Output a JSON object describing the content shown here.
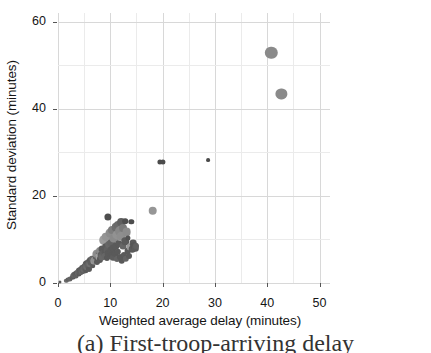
{
  "chart_data": {
    "type": "scatter",
    "title": "",
    "xlabel": "Weighted average delay  (minutes)",
    "ylabel": "Standard deviation (minutes)",
    "xlim": [
      0,
      52
    ],
    "ylim": [
      0,
      62
    ],
    "xticks": [
      0,
      10,
      20,
      30,
      40,
      50
    ],
    "yticks": [
      0,
      20,
      40,
      60
    ],
    "xtick_labels": [
      "0",
      "10",
      "20",
      "30",
      "40",
      "50"
    ],
    "ytick_labels": [
      "0",
      "20",
      "40",
      "60"
    ],
    "x_minor_step": 5,
    "y_minor_step": 10,
    "grid": true,
    "legend": "none",
    "marker_color_dark": "#5a5a5a",
    "marker_color_light": "#9a9a9a",
    "grid_color": "#d8d8d8",
    "axis_color": "#555555",
    "points": [
      {
        "x": 0.4,
        "y": 0.2,
        "r": 1.6,
        "c": "#5a5a5a"
      },
      {
        "x": 1.6,
        "y": 0.5,
        "r": 2.2,
        "c": "#6a6a6a"
      },
      {
        "x": 2.0,
        "y": 0.8,
        "r": 2.4,
        "c": "#5f5f5f"
      },
      {
        "x": 2.3,
        "y": 1.0,
        "r": 2.6,
        "c": "#646464"
      },
      {
        "x": 2.6,
        "y": 1.2,
        "r": 2.3,
        "c": "#5a5a5a"
      },
      {
        "x": 2.8,
        "y": 1.5,
        "r": 2.8,
        "c": "#606060"
      },
      {
        "x": 3.0,
        "y": 1.3,
        "r": 2.4,
        "c": "#5a5a5a"
      },
      {
        "x": 3.1,
        "y": 1.8,
        "r": 3.0,
        "c": "#656565"
      },
      {
        "x": 3.3,
        "y": 2.0,
        "r": 2.7,
        "c": "#5c5c5c"
      },
      {
        "x": 3.5,
        "y": 1.6,
        "r": 2.5,
        "c": "#606060"
      },
      {
        "x": 3.6,
        "y": 2.4,
        "r": 3.1,
        "c": "#5a5a5a"
      },
      {
        "x": 3.8,
        "y": 2.2,
        "r": 2.9,
        "c": "#686868"
      },
      {
        "x": 4.0,
        "y": 2.0,
        "r": 2.6,
        "c": "#5a5a5a"
      },
      {
        "x": 4.0,
        "y": 2.8,
        "r": 3.2,
        "c": "#626262"
      },
      {
        "x": 4.2,
        "y": 2.5,
        "r": 2.8,
        "c": "#5e5e5e"
      },
      {
        "x": 4.3,
        "y": 3.1,
        "r": 3.0,
        "c": "#5a5a5a"
      },
      {
        "x": 4.5,
        "y": 2.7,
        "r": 3.4,
        "c": "#666666"
      },
      {
        "x": 4.6,
        "y": 3.4,
        "r": 2.9,
        "c": "#5a5a5a"
      },
      {
        "x": 4.8,
        "y": 3.0,
        "r": 3.3,
        "c": "#606060"
      },
      {
        "x": 4.9,
        "y": 3.7,
        "r": 3.1,
        "c": "#5d5d5d"
      },
      {
        "x": 5.0,
        "y": 3.2,
        "r": 3.6,
        "c": "#6a6a6a"
      },
      {
        "x": 5.1,
        "y": 4.0,
        "r": 3.0,
        "c": "#5a5a5a"
      },
      {
        "x": 5.2,
        "y": 3.5,
        "r": 3.4,
        "c": "#636363"
      },
      {
        "x": 5.3,
        "y": 2.9,
        "r": 2.7,
        "c": "#5a5a5a"
      },
      {
        "x": 5.4,
        "y": 4.3,
        "r": 3.2,
        "c": "#5f5f5f"
      },
      {
        "x": 5.5,
        "y": 3.8,
        "r": 3.8,
        "c": "#6d6d6d"
      },
      {
        "x": 5.6,
        "y": 4.6,
        "r": 2.9,
        "c": "#5a5a5a"
      },
      {
        "x": 5.8,
        "y": 4.1,
        "r": 3.5,
        "c": "#646464"
      },
      {
        "x": 5.9,
        "y": 3.3,
        "r": 3.0,
        "c": "#5a5a5a"
      },
      {
        "x": 6.0,
        "y": 4.9,
        "r": 3.3,
        "c": "#616161"
      },
      {
        "x": 6.1,
        "y": 4.4,
        "r": 3.7,
        "c": "#707070"
      },
      {
        "x": 6.2,
        "y": 5.2,
        "r": 3.0,
        "c": "#5a5a5a"
      },
      {
        "x": 6.4,
        "y": 4.7,
        "r": 3.4,
        "c": "#5e5e5e"
      },
      {
        "x": 6.5,
        "y": 5.5,
        "r": 3.2,
        "c": "#676767"
      },
      {
        "x": 6.6,
        "y": 4.0,
        "r": 2.8,
        "c": "#5a5a5a"
      },
      {
        "x": 6.8,
        "y": 5.0,
        "r": 3.6,
        "c": "#9a9a9a"
      },
      {
        "x": 7.0,
        "y": 5.8,
        "r": 3.1,
        "c": "#5a5a5a"
      },
      {
        "x": 7.1,
        "y": 5.3,
        "r": 3.9,
        "c": "#8f8f8f"
      },
      {
        "x": 7.2,
        "y": 6.2,
        "r": 3.3,
        "c": "#606060"
      },
      {
        "x": 7.4,
        "y": 4.8,
        "r": 3.0,
        "c": "#5a5a5a"
      },
      {
        "x": 7.5,
        "y": 6.6,
        "r": 4.6,
        "c": "#8d8d8d"
      },
      {
        "x": 7.6,
        "y": 5.6,
        "r": 3.4,
        "c": "#5a5a5a"
      },
      {
        "x": 7.8,
        "y": 7.0,
        "r": 3.2,
        "c": "#656565"
      },
      {
        "x": 7.9,
        "y": 6.0,
        "r": 3.7,
        "c": "#a0a0a0"
      },
      {
        "x": 8.0,
        "y": 5.4,
        "r": 3.1,
        "c": "#5a5a5a"
      },
      {
        "x": 8.1,
        "y": 7.4,
        "r": 4.0,
        "c": "#8a8a8a"
      },
      {
        "x": 8.2,
        "y": 6.4,
        "r": 3.3,
        "c": "#5d5d5d"
      },
      {
        "x": 8.4,
        "y": 5.9,
        "r": 3.6,
        "c": "#686868"
      },
      {
        "x": 8.5,
        "y": 7.8,
        "r": 3.4,
        "c": "#5a5a5a"
      },
      {
        "x": 8.6,
        "y": 6.8,
        "r": 3.0,
        "c": "#626262"
      },
      {
        "x": 8.8,
        "y": 9.8,
        "r": 4.8,
        "c": "#9d9d9d"
      },
      {
        "x": 8.9,
        "y": 7.2,
        "r": 3.5,
        "c": "#5a5a5a"
      },
      {
        "x": 9.0,
        "y": 6.3,
        "r": 3.2,
        "c": "#666666"
      },
      {
        "x": 9.1,
        "y": 8.2,
        "r": 3.8,
        "c": "#5a5a5a"
      },
      {
        "x": 9.2,
        "y": 10.6,
        "r": 4.3,
        "c": "#949494"
      },
      {
        "x": 9.3,
        "y": 5.7,
        "r": 3.1,
        "c": "#5a5a5a"
      },
      {
        "x": 9.4,
        "y": 7.6,
        "r": 3.4,
        "c": "#606060"
      },
      {
        "x": 9.5,
        "y": 15.2,
        "r": 3.6,
        "c": "#4e4e4e"
      },
      {
        "x": 9.6,
        "y": 6.9,
        "r": 3.3,
        "c": "#5a5a5a"
      },
      {
        "x": 9.8,
        "y": 8.8,
        "r": 3.9,
        "c": "#676767"
      },
      {
        "x": 9.9,
        "y": 6.1,
        "r": 3.0,
        "c": "#5a5a5a"
      },
      {
        "x": 10.0,
        "y": 11.4,
        "r": 4.5,
        "c": "#8c8c8c"
      },
      {
        "x": 10.1,
        "y": 7.5,
        "r": 3.4,
        "c": "#5a5a5a"
      },
      {
        "x": 10.2,
        "y": 9.3,
        "r": 3.7,
        "c": "#636363"
      },
      {
        "x": 10.3,
        "y": 6.5,
        "r": 3.1,
        "c": "#5a5a5a"
      },
      {
        "x": 10.4,
        "y": 12.1,
        "r": 4.0,
        "c": "#7d7d7d"
      },
      {
        "x": 10.5,
        "y": 8.0,
        "r": 3.5,
        "c": "#5a5a5a"
      },
      {
        "x": 10.6,
        "y": 5.8,
        "r": 3.2,
        "c": "#5e5e5e"
      },
      {
        "x": 10.8,
        "y": 10.2,
        "r": 4.4,
        "c": "#8a8a8a"
      },
      {
        "x": 10.9,
        "y": 6.7,
        "r": 3.3,
        "c": "#5a5a5a"
      },
      {
        "x": 11.0,
        "y": 12.8,
        "r": 4.2,
        "c": "#6d6d6d"
      },
      {
        "x": 11.1,
        "y": 8.6,
        "r": 3.6,
        "c": "#5a5a5a"
      },
      {
        "x": 11.2,
        "y": 5.5,
        "r": 3.0,
        "c": "#646464"
      },
      {
        "x": 11.3,
        "y": 11.0,
        "r": 4.6,
        "c": "#929292"
      },
      {
        "x": 11.4,
        "y": 7.1,
        "r": 3.2,
        "c": "#5a5a5a"
      },
      {
        "x": 11.5,
        "y": 13.4,
        "r": 4.1,
        "c": "#6a6a6a"
      },
      {
        "x": 11.6,
        "y": 9.0,
        "r": 3.8,
        "c": "#5a5a5a"
      },
      {
        "x": 11.8,
        "y": 12.0,
        "r": 4.9,
        "c": "#878787"
      },
      {
        "x": 11.9,
        "y": 6.0,
        "r": 3.1,
        "c": "#5a5a5a"
      },
      {
        "x": 12.0,
        "y": 13.9,
        "r": 3.9,
        "c": "#606060"
      },
      {
        "x": 12.1,
        "y": 10.8,
        "r": 4.3,
        "c": "#8e8e8e"
      },
      {
        "x": 12.2,
        "y": 5.2,
        "r": 3.3,
        "c": "#5a5a5a"
      },
      {
        "x": 12.4,
        "y": 8.4,
        "r": 3.5,
        "c": "#666666"
      },
      {
        "x": 12.5,
        "y": 12.6,
        "r": 4.0,
        "c": "#7a7a7a"
      },
      {
        "x": 12.6,
        "y": 6.4,
        "r": 3.1,
        "c": "#5a5a5a"
      },
      {
        "x": 12.8,
        "y": 14.2,
        "r": 2.8,
        "c": "#4f4f4f"
      },
      {
        "x": 12.9,
        "y": 9.6,
        "r": 3.7,
        "c": "#5a5a5a"
      },
      {
        "x": 13.0,
        "y": 5.6,
        "r": 3.2,
        "c": "#636363"
      },
      {
        "x": 13.1,
        "y": 11.6,
        "r": 4.4,
        "c": "#8b8b8b"
      },
      {
        "x": 13.3,
        "y": 7.3,
        "r": 3.4,
        "c": "#5a5a5a"
      },
      {
        "x": 13.4,
        "y": 10.4,
        "r": 2.6,
        "c": "#525252"
      },
      {
        "x": 13.6,
        "y": 6.2,
        "r": 3.0,
        "c": "#5a5a5a"
      },
      {
        "x": 13.8,
        "y": 8.2,
        "r": 3.5,
        "c": "#9b9b9b"
      },
      {
        "x": 14.0,
        "y": 14.0,
        "r": 2.7,
        "c": "#4d4d4d"
      },
      {
        "x": 14.2,
        "y": 7.8,
        "r": 3.3,
        "c": "#5a5a5a"
      },
      {
        "x": 14.4,
        "y": 9.2,
        "r": 3.4,
        "c": "#5a5a5a"
      },
      {
        "x": 14.6,
        "y": 8.6,
        "r": 3.8,
        "c": "#555555"
      },
      {
        "x": 14.8,
        "y": 8.0,
        "r": 3.2,
        "c": "#5a5a5a"
      },
      {
        "x": 15.0,
        "y": 8.4,
        "r": 3.0,
        "c": "#606060"
      },
      {
        "x": 18.1,
        "y": 16.6,
        "r": 4.3,
        "c": "#969696"
      },
      {
        "x": 19.5,
        "y": 27.8,
        "r": 2.6,
        "c": "#4b4b4b"
      },
      {
        "x": 20.1,
        "y": 27.8,
        "r": 2.6,
        "c": "#4b4b4b"
      },
      {
        "x": 28.7,
        "y": 28.3,
        "r": 1.9,
        "c": "#4a4a4a"
      },
      {
        "x": 40.8,
        "y": 52.8,
        "r": 6.2,
        "c": "#8a8a8a"
      },
      {
        "x": 42.7,
        "y": 43.5,
        "r": 5.6,
        "c": "#8a8a8a"
      }
    ]
  },
  "caption": {
    "text": "(a) First-troop-arriving delay"
  }
}
